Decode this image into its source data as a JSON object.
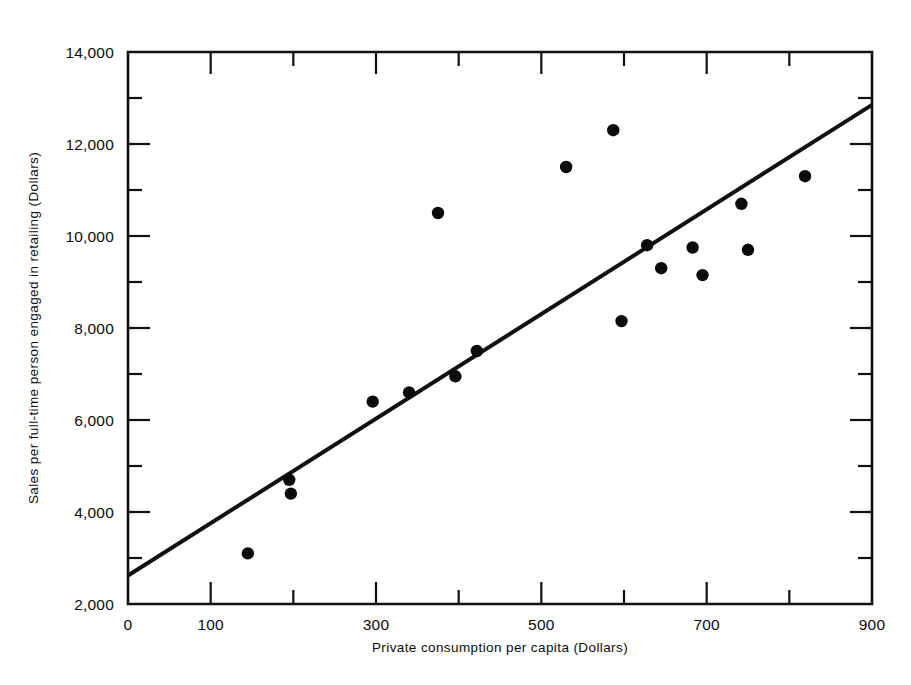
{
  "chart_data": {
    "type": "scatter",
    "title": "",
    "subtitle": "",
    "xlabel": "Private consumption per capita (Dollars)",
    "ylabel": "Sales per full-time person engaged in retailing (Dollars)",
    "xlim": [
      0,
      900
    ],
    "ylim": [
      2000,
      14000
    ],
    "grid": false,
    "legend": null,
    "x_major_ticks": [
      0,
      100,
      300,
      500,
      700,
      900
    ],
    "x_major_tick_labels": [
      "0",
      "100",
      "300",
      "500",
      "700",
      "900"
    ],
    "x_minor_ticks": [
      200,
      400,
      600,
      800
    ],
    "y_major_ticks": [
      2000,
      4000,
      6000,
      8000,
      10000,
      12000,
      14000
    ],
    "y_major_tick_labels": [
      "2,000",
      "4,000",
      "6,000",
      "8,000",
      "10,000",
      "12,000",
      "14,000"
    ],
    "y_minor_ticks": [
      3000,
      5000,
      7000,
      9000,
      11000,
      13000
    ],
    "point_color": "#0b0b0b",
    "line_color": "#111111",
    "series": [
      {
        "name": "observations",
        "points": [
          {
            "x": 145,
            "y": 3100
          },
          {
            "x": 195,
            "y": 4700
          },
          {
            "x": 197,
            "y": 4400
          },
          {
            "x": 296,
            "y": 6400
          },
          {
            "x": 340,
            "y": 6600
          },
          {
            "x": 375,
            "y": 10500
          },
          {
            "x": 396,
            "y": 6950
          },
          {
            "x": 422,
            "y": 7500
          },
          {
            "x": 530,
            "y": 11500
          },
          {
            "x": 587,
            "y": 12300
          },
          {
            "x": 597,
            "y": 8150
          },
          {
            "x": 628,
            "y": 9800
          },
          {
            "x": 645,
            "y": 9300
          },
          {
            "x": 683,
            "y": 9750
          },
          {
            "x": 695,
            "y": 9150
          },
          {
            "x": 742,
            "y": 10700
          },
          {
            "x": 750,
            "y": 9700
          },
          {
            "x": 819,
            "y": 11300
          }
        ]
      }
    ],
    "trend_line": {
      "name": "regression line",
      "x_start": 0,
      "y_start": 2620,
      "x_end": 900,
      "y_end": 12850
    }
  },
  "axes": {
    "y_title": "Sales per full-time person engaged in retailing (Dollars)",
    "x_title": "Private consumption per capita (Dollars)"
  }
}
